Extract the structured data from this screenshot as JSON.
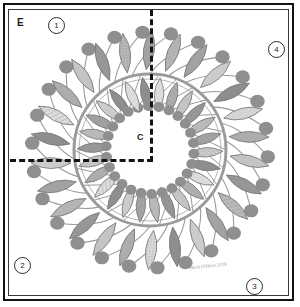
{
  "sheet": {
    "title_letter": "E",
    "center_label": "C",
    "signature": "Barb O'Hare  2016",
    "corner_numbers": [
      {
        "id": "1",
        "label": "1",
        "position": "top-left"
      },
      {
        "id": "4",
        "label": "4",
        "position": "top-right"
      },
      {
        "id": "2",
        "label": "2",
        "position": "bottom-left"
      },
      {
        "id": "3",
        "label": "3",
        "position": "bottom-right"
      }
    ],
    "guides": {
      "vertical_label": "vertical-center-guide",
      "horizontal_label": "horizontal-center-guide",
      "style": "dashed"
    }
  },
  "palette": {
    "ink": "#141414",
    "frame": "#111111",
    "paper": "#ffffff",
    "stem": "#9a9a9a",
    "berry": "#8f8f8f",
    "leaf_tones": [
      "#b9b9b9",
      "#a2a2a2",
      "#cccccc",
      "#8e8e8e",
      "#dcdcdc",
      "#adadad",
      "#c4c4c4",
      "#979797"
    ]
  },
  "artwork": {
    "name": "floral-wreath-quilt-block",
    "ring": {
      "cx": 141,
      "cy": 140,
      "r": 76,
      "stroke": "#9a9a9a",
      "width": 3
    },
    "petal_count": 26,
    "inner_berry_ring_radius": 44,
    "outer_berry_ring_radius": 118
  }
}
